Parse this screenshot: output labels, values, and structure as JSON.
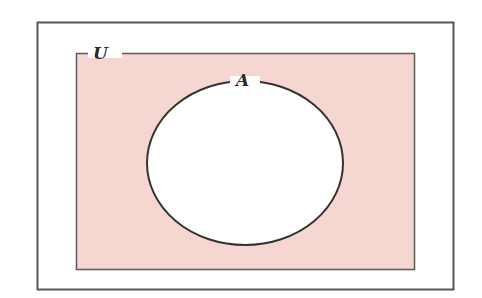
{
  "diagram": {
    "type": "venn",
    "universe": {
      "label": "U",
      "fill": "#f6d6d1"
    },
    "sets": [
      {
        "label": "A",
        "fill": "#ffffff"
      }
    ],
    "colors": {
      "stroke": "#333333",
      "frame": "#555555",
      "shade": "#f6d6d1"
    }
  }
}
